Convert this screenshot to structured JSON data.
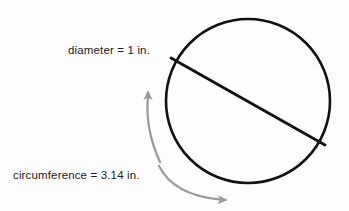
{
  "figure": {
    "background_color": "#fdfdfd",
    "stroke_color": "#111111",
    "arrow_color": "#9a9a9a",
    "text_color": "#1a1a1a",
    "circle": {
      "name": "circle-outline",
      "center_x": 248,
      "center_y": 101,
      "radius": 82,
      "stroke_width": 2.6
    },
    "diameter_line": {
      "name": "diameter-line",
      "x1": 171,
      "y1": 58,
      "x2": 325,
      "y2": 145,
      "stroke_width": 2.8
    },
    "arrows": [
      {
        "name": "circumference-arrow-upper",
        "direction": "counterclockwise-up",
        "tip_x": 148,
        "tip_y": 92
      },
      {
        "name": "circumference-arrow-lower",
        "direction": "clockwise-down-right",
        "tip_x": 228,
        "tip_y": 200
      }
    ],
    "labels": {
      "diameter": "diameter = 1 in.",
      "circumference": "circumference = 3.14 in."
    }
  }
}
